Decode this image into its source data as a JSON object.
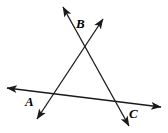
{
  "figure": {
    "type": "geometry-diagram",
    "width": 168,
    "height": 133,
    "background_color": "#ffffff",
    "stroke_color": "#1a1a1a",
    "stroke_width": 1.3,
    "labels": [
      {
        "id": "A",
        "text": "A",
        "x": 25,
        "y": 95
      },
      {
        "id": "B",
        "text": "B",
        "x": 76,
        "y": 17
      },
      {
        "id": "C",
        "text": "C",
        "x": 129,
        "y": 107
      }
    ],
    "vertices": [
      {
        "id": "A",
        "x": 48,
        "y": 96
      },
      {
        "id": "B",
        "x": 85,
        "y": 40
      },
      {
        "id": "C",
        "x": 122,
        "y": 105
      }
    ],
    "lines": [
      {
        "id": "line-base-AC",
        "name": "line-through-A-and-C",
        "x1": 7,
        "y1": 88,
        "x2": 161,
        "y2": 107,
        "arrow_start": true,
        "arrow_end": true
      },
      {
        "id": "line-AB",
        "name": "line-through-A-and-B",
        "x1": 37,
        "y1": 119,
        "x2": 103,
        "y2": 19,
        "arrow_start": true,
        "arrow_end": true
      },
      {
        "id": "line-CB",
        "name": "line-through-C-and-B",
        "x1": 129,
        "y1": 126,
        "x2": 63,
        "y2": 7,
        "arrow_start": true,
        "arrow_end": true
      }
    ]
  }
}
